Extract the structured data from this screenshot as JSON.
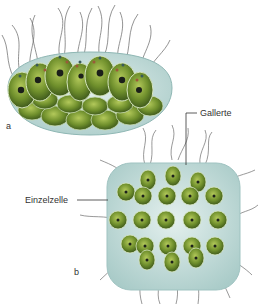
{
  "figure": {
    "panel_a": {
      "letter": "a"
    },
    "panel_b": {
      "letter": "b"
    },
    "labels": {
      "gallerte": "Gallerte",
      "einzelzelle": "Einzelzelle"
    },
    "colors": {
      "jelly": "#cfe3e0",
      "jelly_edge": "#9fc3c1",
      "cell": "#6e8f2a",
      "cell_light": "#a8c050",
      "nucleus": "#1b1f1a",
      "stigma": "#9b5a3a",
      "flagellum": "#4a4a4a"
    }
  }
}
